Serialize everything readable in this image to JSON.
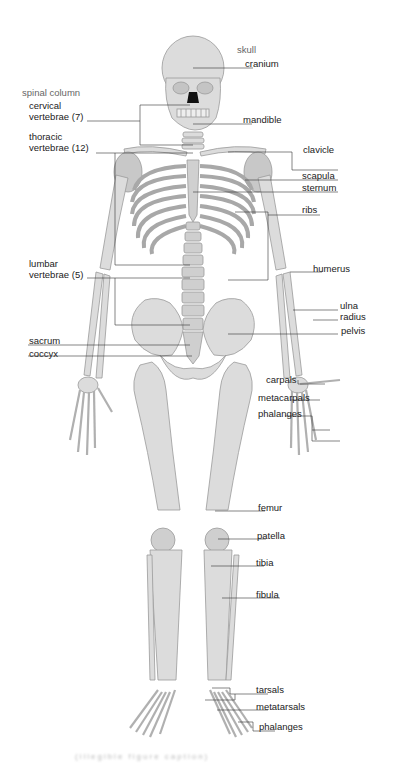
{
  "diagram": {
    "colors": {
      "bone": "#dcdcdc",
      "bone_shade": "#c4c4c4",
      "outline": "#9a9a9a",
      "leader": "#333333",
      "label": "#222222",
      "group_label": "#666666",
      "background": "#ffffff"
    },
    "labels": {
      "skull": "skull",
      "cranium": "cranium",
      "mandible": "mandible",
      "spinal_column": "spinal column",
      "cervical_1": "cervical",
      "cervical_2": "vertebrae (7)",
      "thoracic_1": "thoracic",
      "thoracic_2": "vertebrae (12)",
      "clavicle": "clavicle",
      "scapula": "scapula",
      "sternum": "sternum",
      "ribs": "ribs",
      "lumbar_1": "lumbar",
      "lumbar_2": "vertebrae (5)",
      "humerus": "humerus",
      "ulna": "ulna",
      "radius": "radius",
      "pelvis": "pelvis",
      "sacrum": "sacrum",
      "coccyx": "coccyx",
      "carpals": "carpals",
      "metacarpals": "metacarpals",
      "hand_phalanges": "phalanges",
      "femur": "femur",
      "patella": "patella",
      "tibia": "tibia",
      "fibula": "fibula",
      "tarsals": "tarsals",
      "metatarsals": "metatarsals",
      "foot_phalanges": "phalanges"
    },
    "caption": "(illegible figure caption)"
  }
}
